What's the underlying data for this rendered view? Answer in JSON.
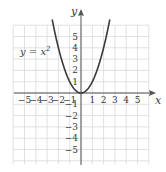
{
  "graph": {
    "equation_label": "y = x",
    "equation_exponent": "2",
    "x_axis_label": "x",
    "y_axis_label": "y",
    "x_ticks": [
      "−5",
      "−4",
      "−3",
      "−2",
      "−1",
      "1",
      "2",
      "3",
      "4",
      "5"
    ],
    "y_ticks": [
      "5",
      "4",
      "3",
      "2",
      "1",
      "−1",
      "−2",
      "−3",
      "−4",
      "−5"
    ],
    "grid_range": {
      "x": [
        -6,
        6
      ],
      "y": [
        -6,
        6
      ]
    },
    "colors": {
      "grid": "#d9d9d9",
      "axes": "#555555",
      "curve": "#3a3a3a"
    }
  },
  "chart_data": {
    "type": "line",
    "xlabel": "x",
    "ylabel": "y",
    "xlim": [
      -6,
      6
    ],
    "ylim": [
      -6,
      6
    ],
    "grid": true,
    "series": [
      {
        "name": "y = x^2",
        "x": [
          -2.4,
          -2,
          -1.5,
          -1,
          -0.5,
          0,
          0.5,
          1,
          1.5,
          2,
          2.4
        ],
        "y": [
          5.76,
          4,
          2.25,
          1,
          0.25,
          0,
          0.25,
          1,
          2.25,
          4,
          5.76
        ]
      }
    ]
  }
}
